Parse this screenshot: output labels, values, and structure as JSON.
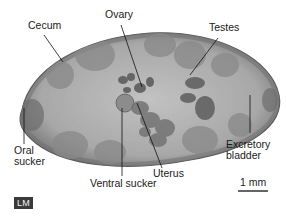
{
  "figure": {
    "type": "light-micrograph",
    "labels": [
      {
        "id": "cecum",
        "text": "Cecum"
      },
      {
        "id": "ovary",
        "text": "Ovary"
      },
      {
        "id": "testes",
        "text": "Testes"
      },
      {
        "id": "oral_sucker",
        "text": "Oral\nsucker"
      },
      {
        "id": "ventral_sucker",
        "text": "Ventral sucker"
      },
      {
        "id": "uterus",
        "text": "Uterus"
      },
      {
        "id": "excretory_bladder",
        "text": "Excretory\nbladder"
      }
    ],
    "scale_bar": {
      "text": "1 mm"
    },
    "badge": {
      "text": "LM"
    },
    "colors": {
      "body_outer": "#7a7a7a",
      "body_inner": "#b4b4b4",
      "cecum": "#8a8a8a",
      "organs": "#6e6e6e",
      "label_text": "#1a1a1a",
      "badge_bg": "#3a3a3a"
    }
  }
}
